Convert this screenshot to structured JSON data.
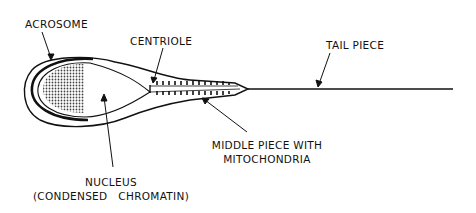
{
  "diagram": {
    "labels": {
      "acrosome": "ACROSOME",
      "centriole": "CENTRIOLE",
      "tail_piece": "TAIL PIECE",
      "middle_piece_line1": "MIDDLE PIECE WITH",
      "middle_piece_line2": "MITOCHONDRIA",
      "nucleus_line1": "NUCLEUS",
      "nucleus_line2": "(CONDENSED   CHROMATIN)"
    },
    "colors": {
      "stroke": "#111111",
      "background": "#ffffff",
      "chromatin_fill": "#8a8a8a"
    }
  }
}
